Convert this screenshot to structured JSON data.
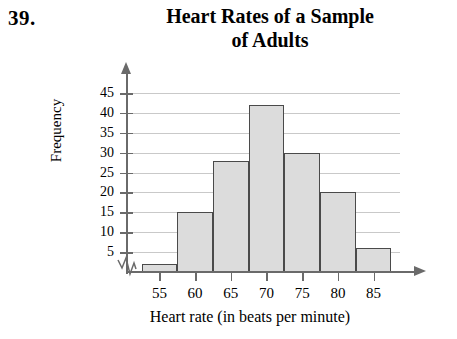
{
  "problem": {
    "number": "39."
  },
  "chart_data": {
    "type": "bar",
    "title": "Heart Rates of a Sample of Adults",
    "title_lines": [
      "Heart Rates of a Sample",
      "of Adults"
    ],
    "xlabel": "Heart rate (in beats per minute)",
    "ylabel": "Frequency",
    "categories": [
      "55",
      "60",
      "65",
      "70",
      "75",
      "80",
      "85"
    ],
    "values": [
      2,
      15,
      28,
      42,
      30,
      20,
      6
    ],
    "xtick_labels": [
      "55",
      "60",
      "65",
      "70",
      "75",
      "80",
      "85"
    ],
    "ytick_labels": [
      "5",
      "10",
      "15",
      "20",
      "25",
      "30",
      "35",
      "40",
      "45"
    ],
    "ytick_values": [
      5,
      10,
      15,
      20,
      25,
      30,
      35,
      40,
      45
    ],
    "ylim": [
      0,
      47
    ],
    "grid": true,
    "legend": "none",
    "axis_break": true,
    "bar_fill": "#dcdcdc",
    "bar_border": "#4a4a4a",
    "gridline_color": "#c9c9c9",
    "axis_color": "#6a6a6a"
  }
}
